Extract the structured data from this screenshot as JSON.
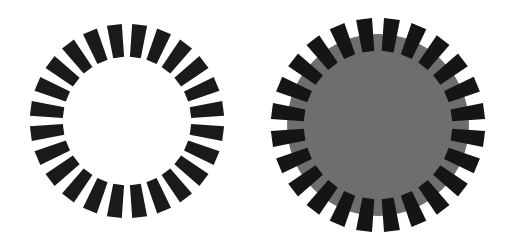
{
  "figures": [
    {
      "name": "dashed-ring",
      "cx": 127,
      "cy": 121,
      "dash_count": 24,
      "outer_r": 97,
      "inner_r": 64,
      "outer_w": 15,
      "inner_w": 11,
      "dash_color": "#1a1a1a",
      "fill": null
    },
    {
      "name": "dashed-ring-with-disc",
      "cx": 378,
      "cy": 125,
      "dash_count": 24,
      "outer_r": 107,
      "inner_r": 74,
      "outer_w": 16,
      "inner_w": 12,
      "dash_color": "#151515",
      "fill": "#6e6e6e",
      "fill_r": 91
    }
  ]
}
